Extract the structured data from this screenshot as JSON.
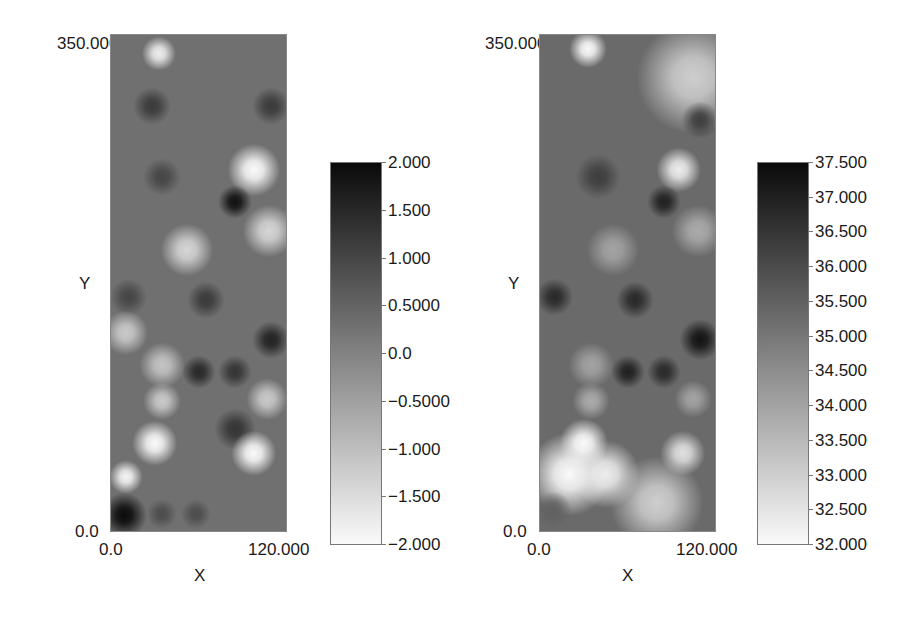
{
  "chart_data": [
    {
      "type": "heatmap",
      "title": "",
      "xlabel": "X",
      "ylabel": "Y",
      "xlim": [
        0.0,
        120.0
      ],
      "ylim": [
        0.0,
        350.0
      ],
      "x_tick_labels": [
        "0.0",
        "120.000"
      ],
      "y_tick_labels": [
        "0.0",
        "350.000"
      ],
      "colormap": "grayscale (white = low, black = high)",
      "colorbar": {
        "range": [
          -2.0,
          2.0
        ],
        "tick_labels": [
          "2.000",
          "1.500",
          "1.000",
          "0.5000",
          "0.0",
          "−0.5000",
          "−1.000",
          "−1.500",
          "−2.000"
        ],
        "tick_values": [
          2.0,
          1.5,
          1.0,
          0.5,
          0.0,
          -0.5,
          -1.0,
          -1.5,
          -2.0
        ]
      },
      "background_value": 0.3,
      "features": [
        {
          "x": 33,
          "y": 337,
          "value": -1.8,
          "r": 9
        },
        {
          "x": 98,
          "y": 255,
          "value": -2.0,
          "r": 14
        },
        {
          "x": 85,
          "y": 232,
          "value": 1.9,
          "r": 9
        },
        {
          "x": 108,
          "y": 212,
          "value": -1.4,
          "r": 14
        },
        {
          "x": 52,
          "y": 198,
          "value": -1.4,
          "r": 14
        },
        {
          "x": 35,
          "y": 250,
          "value": 1.0,
          "r": 10
        },
        {
          "x": 28,
          "y": 300,
          "value": 1.2,
          "r": 10
        },
        {
          "x": 110,
          "y": 300,
          "value": 1.2,
          "r": 10
        },
        {
          "x": 65,
          "y": 163,
          "value": 1.2,
          "r": 10
        },
        {
          "x": 12,
          "y": 165,
          "value": 1.0,
          "r": 10
        },
        {
          "x": 10,
          "y": 140,
          "value": -1.2,
          "r": 12
        },
        {
          "x": 110,
          "y": 135,
          "value": 1.6,
          "r": 10
        },
        {
          "x": 60,
          "y": 112,
          "value": 1.5,
          "r": 9
        },
        {
          "x": 85,
          "y": 112,
          "value": 1.3,
          "r": 9
        },
        {
          "x": 35,
          "y": 117,
          "value": -1.1,
          "r": 12
        },
        {
          "x": 35,
          "y": 92,
          "value": -1.2,
          "r": 10
        },
        {
          "x": 107,
          "y": 93,
          "value": -1.2,
          "r": 11
        },
        {
          "x": 30,
          "y": 62,
          "value": -2.0,
          "r": 12
        },
        {
          "x": 85,
          "y": 72,
          "value": 1.3,
          "r": 11
        },
        {
          "x": 98,
          "y": 55,
          "value": -2.0,
          "r": 12
        },
        {
          "x": 10,
          "y": 38,
          "value": -1.9,
          "r": 9
        },
        {
          "x": 9,
          "y": 11,
          "value": 2.0,
          "r": 12
        },
        {
          "x": 35,
          "y": 12,
          "value": 0.9,
          "r": 8
        },
        {
          "x": 58,
          "y": 12,
          "value": 0.9,
          "r": 8
        }
      ]
    },
    {
      "type": "heatmap",
      "title": "",
      "xlabel": "X",
      "ylabel": "Y",
      "xlim": [
        0.0,
        120.0
      ],
      "ylim": [
        0.0,
        350.0
      ],
      "x_tick_labels": [
        "0.0",
        "120.000"
      ],
      "y_tick_labels": [
        "0.0",
        "350.000"
      ],
      "colormap": "grayscale (white = low, black = high)",
      "colorbar": {
        "range": [
          32.0,
          37.5
        ],
        "tick_labels": [
          "37.500",
          "37.000",
          "36.500",
          "36.000",
          "35.500",
          "35.000",
          "34.500",
          "34.000",
          "33.500",
          "33.000",
          "32.500",
          "32.000"
        ],
        "tick_values": [
          37.5,
          37.0,
          36.5,
          36.0,
          35.5,
          35.0,
          34.5,
          34.0,
          33.5,
          33.0,
          32.5,
          32.0
        ]
      },
      "background_value": 35.3,
      "features": [
        {
          "x": 105,
          "y": 320,
          "value": 33.0,
          "r": 30
        },
        {
          "x": 33,
          "y": 340,
          "value": 32.0,
          "r": 10
        },
        {
          "x": 95,
          "y": 255,
          "value": 32.3,
          "r": 12
        },
        {
          "x": 85,
          "y": 232,
          "value": 37.0,
          "r": 9
        },
        {
          "x": 40,
          "y": 250,
          "value": 36.3,
          "r": 12
        },
        {
          "x": 108,
          "y": 212,
          "value": 33.8,
          "r": 14
        },
        {
          "x": 50,
          "y": 198,
          "value": 34.0,
          "r": 14
        },
        {
          "x": 110,
          "y": 290,
          "value": 36.3,
          "r": 10
        },
        {
          "x": 65,
          "y": 163,
          "value": 36.8,
          "r": 10
        },
        {
          "x": 10,
          "y": 165,
          "value": 36.8,
          "r": 10
        },
        {
          "x": 110,
          "y": 135,
          "value": 37.3,
          "r": 11
        },
        {
          "x": 60,
          "y": 112,
          "value": 37.0,
          "r": 9
        },
        {
          "x": 85,
          "y": 112,
          "value": 36.8,
          "r": 9
        },
        {
          "x": 35,
          "y": 117,
          "value": 34.0,
          "r": 12
        },
        {
          "x": 35,
          "y": 92,
          "value": 33.8,
          "r": 10
        },
        {
          "x": 105,
          "y": 93,
          "value": 34.0,
          "r": 10
        },
        {
          "x": 30,
          "y": 62,
          "value": 32.0,
          "r": 13
        },
        {
          "x": 20,
          "y": 40,
          "value": 32.0,
          "r": 22
        },
        {
          "x": 45,
          "y": 40,
          "value": 32.3,
          "r": 18
        },
        {
          "x": 98,
          "y": 55,
          "value": 32.6,
          "r": 12
        },
        {
          "x": 80,
          "y": 20,
          "value": 33.0,
          "r": 25
        },
        {
          "x": 9,
          "y": 15,
          "value": 35.5,
          "r": 10
        }
      ]
    }
  ],
  "plots": [
    {
      "y_max_label": "350.000",
      "y_min_label": "0.0",
      "x_min_label": "0.0",
      "x_max_label": "120.000",
      "x_axis_label": "X",
      "y_axis_label": "Y",
      "colorbar_ticks": [
        "2.000",
        "1.500",
        "1.000",
        "0.5000",
        "0.0",
        "−0.5000",
        "−1.000",
        "−1.500",
        "−2.000"
      ]
    },
    {
      "y_max_label": "350.000",
      "y_min_label": "0.0",
      "x_min_label": "0.0",
      "x_max_label": "120.000",
      "x_axis_label": "X",
      "y_axis_label": "Y",
      "colorbar_ticks": [
        "37.500",
        "37.000",
        "36.500",
        "36.000",
        "35.500",
        "35.000",
        "34.500",
        "34.000",
        "33.500",
        "33.000",
        "32.500",
        "32.000"
      ]
    }
  ]
}
